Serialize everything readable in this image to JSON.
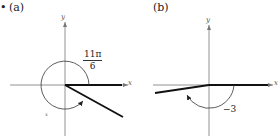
{
  "figure": {
    "bullet": "•",
    "panels": [
      {
        "id": "a",
        "label": "(a)",
        "axis_x_label": "x",
        "axis_y_label": "y",
        "angle_label_numerator": "11π",
        "angle_label_denominator": "6",
        "angle_value": "11π/6",
        "stray_mark": "x"
      },
      {
        "id": "b",
        "label": "(b)",
        "axis_x_label": "x",
        "axis_y_label": "y",
        "angle_label": "−3",
        "angle_value": "-3"
      }
    ],
    "colors": {
      "axis": "#777777",
      "terminal_ray": "#111111",
      "arc": "#333333",
      "text": "#222222"
    }
  }
}
